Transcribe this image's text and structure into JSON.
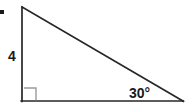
{
  "figure": {
    "type": "right-triangle-diagram",
    "labels": {
      "leg_label": "4",
      "angle_label": "30°"
    },
    "colors": {
      "stroke": "#262626",
      "right_angle_marker": "#9a9a9a",
      "text": "#1a1a1a",
      "background": "#ffffff"
    },
    "geometry": {
      "apex": [
        22,
        7
      ],
      "right_angle_vertex": [
        22,
        101
      ],
      "angle_vertex": [
        183,
        101
      ],
      "stroke_width": 1.6,
      "right_angle_marker_size": 12
    },
    "marks": {
      "corner_dot": "corner-dot-mark"
    }
  }
}
